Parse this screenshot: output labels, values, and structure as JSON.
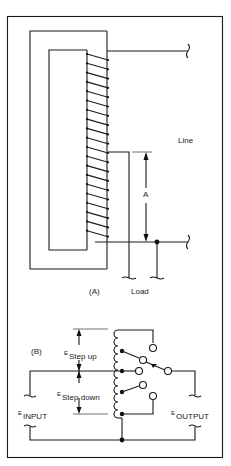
{
  "figure": {
    "panel_a": {
      "label": "(A)",
      "line_label": "Line",
      "load_label": "Load",
      "dimension_label": "A"
    },
    "panel_b": {
      "label": "(B)",
      "e_symbol": "E",
      "step_up_label": "Step up",
      "step_down_label": "Step down",
      "input_label": "INPUT",
      "output_label": "OUTPUT"
    }
  },
  "colors": {
    "line": "#1a1a1a",
    "background": "#ffffff"
  }
}
